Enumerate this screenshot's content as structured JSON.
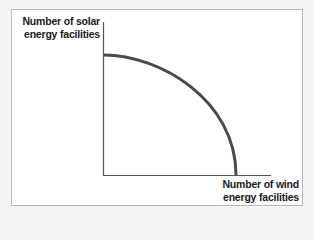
{
  "diagram": {
    "type": "production-possibilities-frontier",
    "y_axis_label_line1": "Number of solar",
    "y_axis_label_line2": "energy facilities",
    "x_axis_label_line1": "Number of wind",
    "x_axis_label_line2": "energy facilities",
    "curve_color": "#4a4a4a",
    "axis_color": "#555555"
  }
}
